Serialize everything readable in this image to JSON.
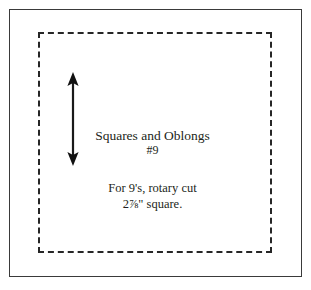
{
  "diagram": {
    "kind": "quilt-block-cutting-diagram",
    "background_color": "#ffffff",
    "outer_border": {
      "style": "solid",
      "color": "#3a3a3a",
      "width_px": 1.5
    },
    "inner_border": {
      "style": "dashed",
      "color": "#262626",
      "width_px": 2,
      "dash_length_px": 8,
      "gap_length_px": 5
    },
    "dimension_arrow": {
      "orientation": "vertical",
      "heads": "double",
      "color": "#1a1a1a",
      "label": ""
    },
    "labels": {
      "block_name": "Squares and Oblongs",
      "block_number": "#9",
      "instruction_line_1": "For 9's, rotary cut",
      "instruction_measure": "2",
      "instruction_fraction": "⅞",
      "instruction_unit": "\"",
      "instruction_line_2_suffix": " square.",
      "instruction_line_2_full": "2⅞\" square."
    }
  }
}
